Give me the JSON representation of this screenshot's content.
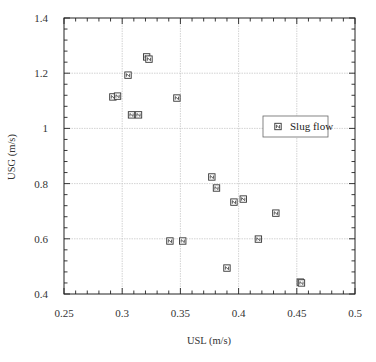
{
  "chart_data": {
    "type": "scatter",
    "title": "",
    "xlabel": "USL (m/s)",
    "ylabel": "USG (m/s)",
    "xlim": [
      0.25,
      0.5
    ],
    "ylim": [
      0.4,
      1.4
    ],
    "x_ticks": [
      0.25,
      0.3,
      0.35,
      0.4,
      0.45,
      0.5
    ],
    "x_tick_labels": [
      "0.25",
      "0.3",
      "0.35",
      "0.4",
      "0.45",
      "0.5"
    ],
    "y_ticks": [
      0.4,
      0.6,
      0.8,
      1.0,
      1.2,
      1.4
    ],
    "y_tick_labels": [
      "0.4",
      "0.6",
      "0.8",
      "1",
      "1.2",
      "1.4"
    ],
    "x_minor_step": 0.01,
    "y_minor_step": 0.04,
    "grid": true,
    "legend": {
      "position": "right-middle",
      "entries": [
        "Slug flow"
      ]
    },
    "series": [
      {
        "name": "Slug flow",
        "marker": "square-with-slash",
        "color": "#333333",
        "points": [
          {
            "x": 0.321,
            "y": 1.259
          },
          {
            "x": 0.323,
            "y": 1.251
          },
          {
            "x": 0.305,
            "y": 1.193
          },
          {
            "x": 0.292,
            "y": 1.114
          },
          {
            "x": 0.296,
            "y": 1.117
          },
          {
            "x": 0.347,
            "y": 1.11
          },
          {
            "x": 0.308,
            "y": 1.049
          },
          {
            "x": 0.314,
            "y": 1.049
          },
          {
            "x": 0.377,
            "y": 0.824
          },
          {
            "x": 0.381,
            "y": 0.784
          },
          {
            "x": 0.396,
            "y": 0.733
          },
          {
            "x": 0.404,
            "y": 0.744
          },
          {
            "x": 0.432,
            "y": 0.693
          },
          {
            "x": 0.417,
            "y": 0.599
          },
          {
            "x": 0.341,
            "y": 0.592
          },
          {
            "x": 0.352,
            "y": 0.592
          },
          {
            "x": 0.39,
            "y": 0.494
          },
          {
            "x": 0.453,
            "y": 0.443
          },
          {
            "x": 0.454,
            "y": 0.44
          }
        ]
      }
    ]
  },
  "colors": {
    "axis": "#222222",
    "grid": "#c8c8c8",
    "marker": "#333333",
    "background": "#ffffff"
  }
}
